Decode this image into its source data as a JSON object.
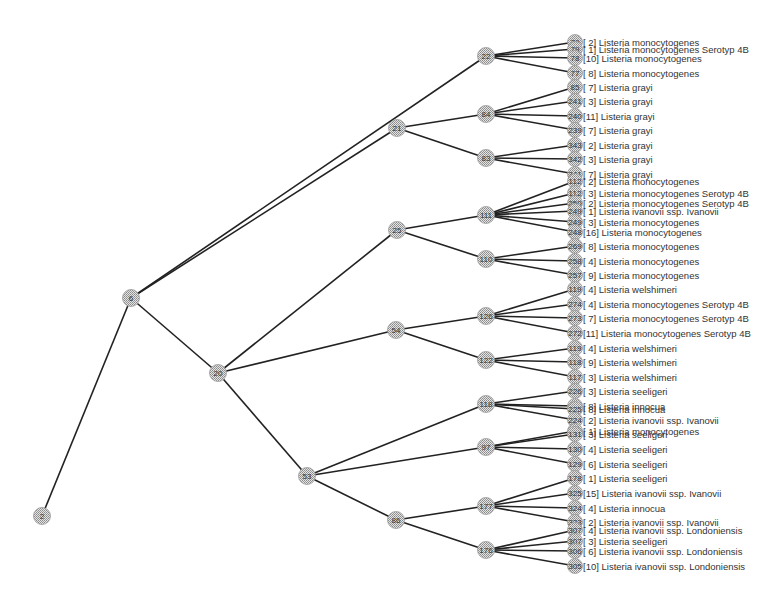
{
  "diagram": {
    "type": "phylogenetic-tree",
    "colors": {
      "edge": "#222222",
      "node_fill": "#c8c8c8",
      "text": "#333333",
      "background": "#ffffff"
    },
    "internal_nodes": [
      {
        "id": "2",
        "x": 42,
        "y": 516
      },
      {
        "id": "6",
        "x": 131,
        "y": 298
      },
      {
        "id": "20",
        "x": 218,
        "y": 373
      },
      {
        "id": "21",
        "x": 397,
        "y": 128
      },
      {
        "id": "22",
        "x": 486,
        "y": 56
      },
      {
        "id": "84",
        "x": 486,
        "y": 114
      },
      {
        "id": "83",
        "x": 486,
        "y": 158
      },
      {
        "id": "25",
        "x": 397,
        "y": 230
      },
      {
        "id": "111",
        "x": 486,
        "y": 215
      },
      {
        "id": "110",
        "x": 486,
        "y": 259
      },
      {
        "id": "54",
        "x": 396,
        "y": 330
      },
      {
        "id": "126",
        "x": 486,
        "y": 316
      },
      {
        "id": "122",
        "x": 486,
        "y": 360
      },
      {
        "id": "53",
        "x": 307,
        "y": 476
      },
      {
        "id": "118",
        "x": 486,
        "y": 404
      },
      {
        "id": "97",
        "x": 486,
        "y": 447
      },
      {
        "id": "86",
        "x": 396,
        "y": 520
      },
      {
        "id": "177",
        "x": 486,
        "y": 506
      },
      {
        "id": "176",
        "x": 486,
        "y": 550
      }
    ],
    "edges": [
      [
        "2",
        "6"
      ],
      [
        "6",
        "22"
      ],
      [
        "6",
        "21"
      ],
      [
        "6",
        "20"
      ],
      [
        "21",
        "84"
      ],
      [
        "21",
        "83"
      ],
      [
        "20",
        "25"
      ],
      [
        "20",
        "54"
      ],
      [
        "20",
        "53"
      ],
      [
        "25",
        "111"
      ],
      [
        "25",
        "110"
      ],
      [
        "54",
        "126"
      ],
      [
        "54",
        "122"
      ],
      [
        "53",
        "118"
      ],
      [
        "53",
        "97"
      ],
      [
        "53",
        "86"
      ],
      [
        "86",
        "177"
      ],
      [
        "86",
        "176"
      ]
    ],
    "leaves": [
      {
        "parent": "22",
        "id": "79",
        "y": 42,
        "label": "[ 2] Listeria monocytogenes"
      },
      {
        "parent": "22",
        "id": "79",
        "y": 49,
        "label": "[ 1] Listeria monocytogenes Serotyp 4B"
      },
      {
        "parent": "22",
        "id": "78",
        "y": 58,
        "label": "[10] Listeria monocytogenes"
      },
      {
        "parent": "22",
        "id": "77",
        "y": 73,
        "label": "[ 8] Listeria monocytogenes"
      },
      {
        "parent": "84",
        "id": "85",
        "y": 87,
        "label": "[ 7] Listeria grayi"
      },
      {
        "parent": "84",
        "id": "241",
        "y": 101,
        "label": "[ 3] Listeria grayi"
      },
      {
        "parent": "84",
        "id": "240",
        "y": 116,
        "label": "[11] Listeria grayi"
      },
      {
        "parent": "84",
        "id": "239",
        "y": 130,
        "label": "[ 7] Listeria grayi"
      },
      {
        "parent": "83",
        "id": "343",
        "y": 145,
        "label": "[ 2] Listeria grayi"
      },
      {
        "parent": "83",
        "id": "342",
        "y": 159,
        "label": "[ 3] Listeria grayi"
      },
      {
        "parent": "83",
        "id": "341",
        "y": 174,
        "label": "[ 7] Listeria grayi"
      },
      {
        "parent": "111",
        "id": "112",
        "y": 181,
        "label": "[ 2] Listeria monocytogenes"
      },
      {
        "parent": "111",
        "id": "112",
        "y": 193,
        "label": "[ 3] Listeria monocytogenes Serotyp 4B"
      },
      {
        "parent": "111",
        "id": "250",
        "y": 203,
        "label": "[ 2] Listeria monocytogenes Serotyp 4B"
      },
      {
        "parent": "111",
        "id": "249",
        "y": 211,
        "label": "[ 1] Listeria ivanovii ssp. Ivanovii"
      },
      {
        "parent": "111",
        "id": "249",
        "y": 222,
        "label": "[ 3] Listeria monocytogenes"
      },
      {
        "parent": "111",
        "id": "248",
        "y": 232,
        "label": "[16] Listeria monocytogenes"
      },
      {
        "parent": "110",
        "id": "269",
        "y": 246,
        "label": "[ 8] Listeria monocytogenes"
      },
      {
        "parent": "110",
        "id": "258",
        "y": 261,
        "label": "[ 4] Listeria monocytogenes"
      },
      {
        "parent": "110",
        "id": "257",
        "y": 275,
        "label": "[ 9] Listeria monocytogenes"
      },
      {
        "parent": "126",
        "id": "119",
        "y": 289,
        "label": "[ 4] Listeria welshimeri"
      },
      {
        "parent": "126",
        "id": "274",
        "y": 304,
        "label": "[ 4] Listeria monocytogenes Serotyp 4B"
      },
      {
        "parent": "126",
        "id": "273",
        "y": 318,
        "label": "[ 7] Listeria monocytogenes Serotyp 4B"
      },
      {
        "parent": "126",
        "id": "272",
        "y": 333,
        "label": "[11] Listeria monocytogenes Serotyp 4B"
      },
      {
        "parent": "122",
        "id": "119",
        "y": 348,
        "label": "[ 4] Listeria welshimeri"
      },
      {
        "parent": "122",
        "id": "118",
        "y": 362,
        "label": "[ 9] Listeria welshimeri"
      },
      {
        "parent": "122",
        "id": "117",
        "y": 377,
        "label": "[ 3] Listeria welshimeri"
      },
      {
        "parent": "118",
        "id": "226",
        "y": 391,
        "label": "[ 3] Listeria seeligeri"
      },
      {
        "parent": "118",
        "id": "225",
        "y": 406,
        "label": "[ 8] Listeria innocua"
      },
      {
        "parent": "118",
        "id": "225",
        "y": 409,
        "label": "[ 8] Listeria innocua"
      },
      {
        "parent": "118",
        "id": "224",
        "y": 420,
        "label": "[ 2] Listeria ivanovii ssp. Ivanovii"
      },
      {
        "parent": "97",
        "id": "131",
        "y": 431,
        "label": "[ 1] Listeria monocytogenes"
      },
      {
        "parent": "97",
        "id": "131",
        "y": 434,
        "label": "[ 3] Listeria seeligeri"
      },
      {
        "parent": "97",
        "id": "130",
        "y": 449,
        "label": "[ 4] Listeria seeligeri"
      },
      {
        "parent": "97",
        "id": "129",
        "y": 464,
        "label": "[ 6] Listeria seeligeri"
      },
      {
        "parent": "177",
        "id": "178",
        "y": 478,
        "label": "[ 1] Listeria seeligeri"
      },
      {
        "parent": "177",
        "id": "325",
        "y": 493,
        "label": "[15] Listeria ivanovii ssp. Ivanovii"
      },
      {
        "parent": "177",
        "id": "324",
        "y": 508,
        "label": "[ 4] Listeria innocua"
      },
      {
        "parent": "177",
        "id": "323",
        "y": 522,
        "label": "[ 2] Listeria ivanovii ssp. Ivanovii"
      },
      {
        "parent": "176",
        "id": "307",
        "y": 530,
        "label": "[ 4] Listeria ivanovii ssp. Londoniensis"
      },
      {
        "parent": "176",
        "id": "307",
        "y": 541,
        "label": "[ 3] Listeria seeligeri"
      },
      {
        "parent": "176",
        "id": "306",
        "y": 551,
        "label": "[ 6] Listeria ivanovii ssp. Londoniensis"
      },
      {
        "parent": "176",
        "id": "305",
        "y": 566,
        "label": "[10] Listeria ivanovii ssp. Londoniensis"
      }
    ],
    "leaf_x": 575,
    "label_x": 583
  }
}
